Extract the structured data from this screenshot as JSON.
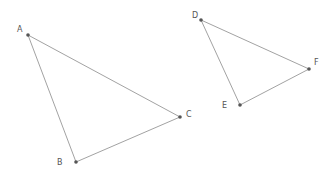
{
  "diagram": {
    "type": "geometry-triangles",
    "colors": {
      "line": "#8a8a8a",
      "point": "#555555",
      "label": "#555555",
      "background": "#ffffff"
    },
    "triangles": [
      {
        "name": "ABC",
        "vertices": [
          {
            "label": "A",
            "x": 28,
            "y": 35,
            "lx": 17,
            "ly": 32
          },
          {
            "label": "B",
            "x": 76,
            "y": 162,
            "lx": 57,
            "ly": 165
          },
          {
            "label": "C",
            "x": 180,
            "y": 117,
            "lx": 186,
            "ly": 117
          }
        ]
      },
      {
        "name": "DEF",
        "vertices": [
          {
            "label": "D",
            "x": 201,
            "y": 20,
            "lx": 192,
            "ly": 18
          },
          {
            "label": "E",
            "x": 240,
            "y": 105,
            "lx": 222,
            "ly": 108
          },
          {
            "label": "F",
            "x": 309,
            "y": 69,
            "lx": 314,
            "ly": 65
          }
        ]
      }
    ]
  }
}
